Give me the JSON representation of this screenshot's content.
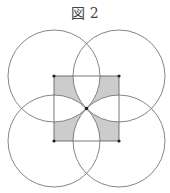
{
  "figure": {
    "title": "図 2",
    "square": {
      "x": 54,
      "y": 76,
      "size": 65
    },
    "center": {
      "x": 86.5,
      "y": 108.5
    },
    "radius": 46,
    "circles": [
      {
        "cx": 54,
        "cy": 76
      },
      {
        "cx": 119,
        "cy": 76
      },
      {
        "cx": 54,
        "cy": 141
      },
      {
        "cx": 119,
        "cy": 141
      }
    ],
    "colors": {
      "stroke": "#666666",
      "shade": "#cccccc",
      "point": "#222222"
    }
  }
}
